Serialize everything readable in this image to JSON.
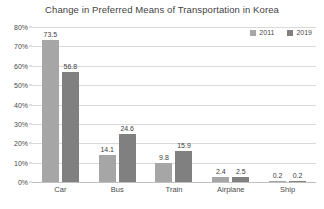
{
  "chart_data": {
    "type": "bar",
    "title": "Change in Preferred Means of Transportation in Korea",
    "xlabel": "",
    "ylabel": "",
    "categories": [
      "Car",
      "Bus",
      "Train",
      "Airplane",
      "Ship"
    ],
    "series": [
      {
        "name": "2011",
        "color": "#a6a6a6",
        "values": [
          73.5,
          14.1,
          9.8,
          2.4,
          0.2
        ]
      },
      {
        "name": "2019",
        "color": "#808080",
        "values": [
          56.8,
          24.6,
          15.9,
          2.5,
          0.2
        ]
      }
    ],
    "ylim": [
      0,
      80
    ],
    "ytick_values": [
      0,
      10,
      20,
      30,
      40,
      50,
      60,
      70,
      80
    ],
    "ytick_labels": [
      "0%",
      "10%",
      "20%",
      "30%",
      "40%",
      "50%",
      "60%",
      "70%",
      "80%"
    ],
    "grid": true,
    "legend_position": "top-right",
    "data_labels": true,
    "value_unit": "%",
    "colors": {
      "gridline": "#d9d9d9",
      "axis": "#bfbfbf",
      "text": "#404040",
      "background": "#ffffff"
    }
  }
}
